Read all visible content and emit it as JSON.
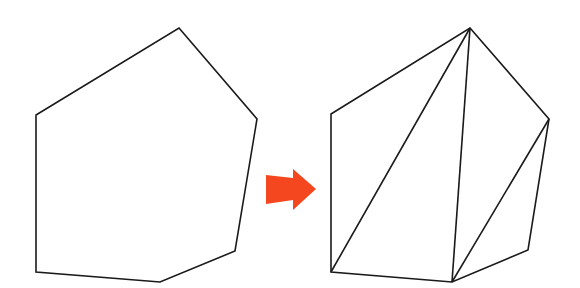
{
  "diagram": {
    "title": "",
    "colors": {
      "background": "#ffffff",
      "stroke": "#1a1a1a",
      "arrow": "#f4471f"
    },
    "left_polygon": {
      "label": "",
      "vertices": [
        [
          179,
          28
        ],
        [
          257,
          119
        ],
        [
          235,
          251
        ],
        [
          160,
          282
        ],
        [
          36,
          272
        ],
        [
          36,
          115
        ]
      ]
    },
    "right_polygon": {
      "label": "",
      "vertices": [
        [
          470,
          28
        ],
        [
          549,
          119
        ],
        [
          528,
          250
        ],
        [
          452,
          282
        ],
        [
          331,
          272
        ],
        [
          331,
          114
        ]
      ],
      "diagonals": [
        [
          [
            470,
            28
          ],
          [
            331,
            272
          ]
        ],
        [
          [
            470,
            28
          ],
          [
            452,
            282
          ]
        ],
        [
          [
            549,
            119
          ],
          [
            452,
            282
          ]
        ]
      ]
    },
    "arrow": {
      "direction": "right",
      "points": [
        [
          266,
          175
        ],
        [
          293,
          178
        ],
        [
          293,
          169
        ],
        [
          316,
          189
        ],
        [
          293,
          210
        ],
        [
          293,
          200
        ],
        [
          266,
          204
        ]
      ]
    }
  }
}
